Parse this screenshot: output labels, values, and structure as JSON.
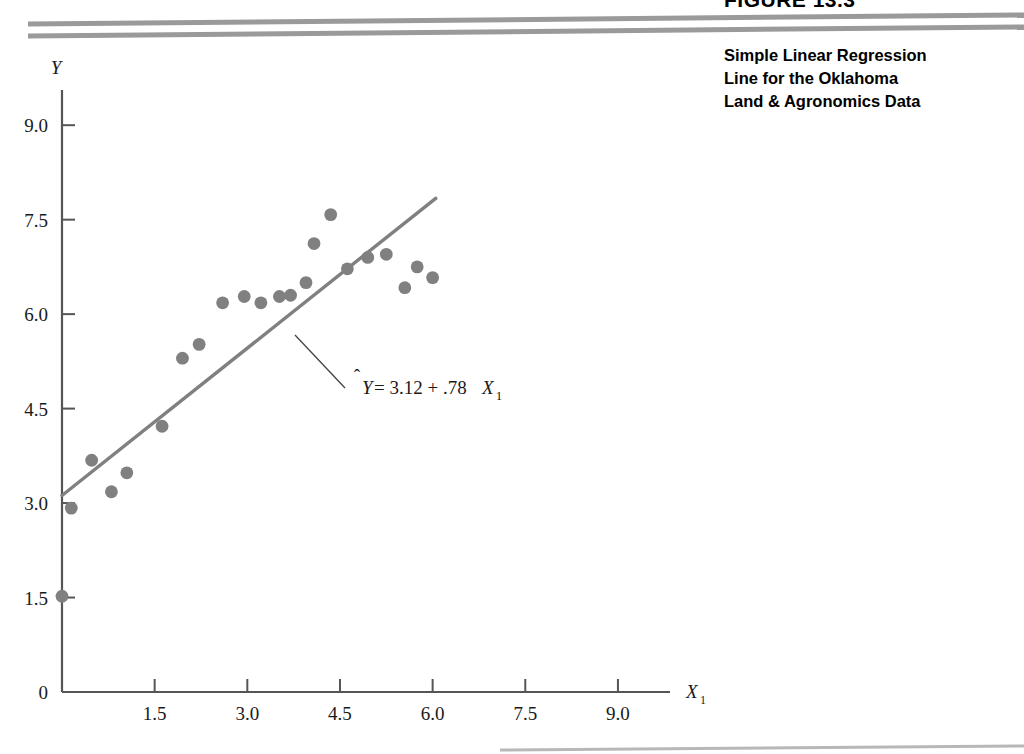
{
  "figure": {
    "number_label": "FIGURE 13.3",
    "caption_lines": [
      "Simple Linear Regression",
      "Line for the Oklahoma",
      "Land & Agronomics Data"
    ]
  },
  "colors": {
    "marker": "#808080",
    "regression_line": "#808080",
    "axis": "#555555",
    "rule": "#9a9a9a",
    "text": "#1a1a1a"
  },
  "chart_data": {
    "type": "scatter",
    "title": "Simple Linear Regression Line for the Oklahoma Land & Agronomics Data",
    "xlabel": "X1",
    "ylabel": "Y",
    "xlim": [
      0,
      9.6
    ],
    "ylim": [
      0,
      9.4
    ],
    "grid": false,
    "legend": "none",
    "xticks": [
      "0",
      "1.5",
      "3.0",
      "4.5",
      "6.0",
      "7.5",
      "9.0"
    ],
    "xtick_values": [
      0,
      1.5,
      3.0,
      4.5,
      6.0,
      7.5,
      9.0
    ],
    "yticks": [
      "0",
      "1.5",
      "3.0",
      "4.5",
      "6.0",
      "7.5",
      "9.0"
    ],
    "ytick_values": [
      0,
      1.5,
      3.0,
      4.5,
      6.0,
      7.5,
      9.0
    ],
    "points": [
      {
        "x": 0.0,
        "y": 1.52
      },
      {
        "x": 0.15,
        "y": 2.92
      },
      {
        "x": 0.48,
        "y": 3.68
      },
      {
        "x": 0.8,
        "y": 3.18
      },
      {
        "x": 1.05,
        "y": 3.48
      },
      {
        "x": 1.62,
        "y": 4.22
      },
      {
        "x": 1.95,
        "y": 5.3
      },
      {
        "x": 2.22,
        "y": 5.52
      },
      {
        "x": 2.6,
        "y": 6.18
      },
      {
        "x": 2.95,
        "y": 6.28
      },
      {
        "x": 3.22,
        "y": 6.18
      },
      {
        "x": 3.52,
        "y": 6.28
      },
      {
        "x": 3.7,
        "y": 6.3
      },
      {
        "x": 3.95,
        "y": 6.5
      },
      {
        "x": 4.08,
        "y": 7.12
      },
      {
        "x": 4.35,
        "y": 7.58
      },
      {
        "x": 4.62,
        "y": 6.72
      },
      {
        "x": 4.95,
        "y": 6.9
      },
      {
        "x": 5.25,
        "y": 6.95
      },
      {
        "x": 5.55,
        "y": 6.42
      },
      {
        "x": 5.75,
        "y": 6.75
      },
      {
        "x": 6.0,
        "y": 6.58
      }
    ],
    "regression": {
      "equation_display": "Ŷ = 3.12 + .78X₁",
      "intercept": 3.12,
      "slope": 0.78,
      "x_start": 0.0,
      "x_end": 6.05,
      "annotation_text_parts": {
        "yhat": "Y",
        "body": " = 3.12 + .78",
        "xvar": "X",
        "xsub": "1"
      }
    }
  }
}
